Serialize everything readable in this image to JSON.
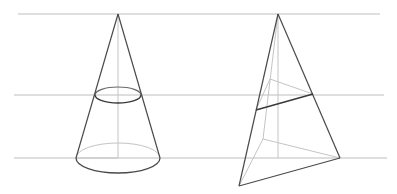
{
  "diagram": {
    "colors": {
      "background": "#ffffff",
      "guide_line": "#bdbdbd",
      "visible_edge": "#4a4a4a",
      "hidden_edge": "#c4c4c4",
      "section_edge": "#3a3a3a"
    },
    "guide_lines": [
      {
        "name": "top-plane",
        "y": 14,
        "x1": 18,
        "x2": 380
      },
      {
        "name": "middle-plane",
        "y": 95,
        "x1": 14,
        "x2": 384
      },
      {
        "name": "base-plane",
        "y": 158,
        "x1": 14,
        "x2": 387
      }
    ],
    "cone": {
      "apex": [
        118,
        14
      ],
      "base_center": [
        118,
        158
      ],
      "base_rx": 42,
      "base_ry": 15,
      "section_center": [
        118,
        95
      ],
      "section_rx": 23,
      "section_ry": 8
    },
    "pyramid": {
      "apex": [
        278,
        14
      ],
      "base": {
        "front_left": [
          239,
          186
        ],
        "front_right": [
          340,
          158
        ],
        "back": [
          263,
          139
        ]
      },
      "section": {
        "left": [
          256,
          110
        ],
        "right": [
          313,
          94
        ],
        "back": [
          270,
          79
        ]
      },
      "height_foot": [
        278,
        158
      ]
    }
  }
}
